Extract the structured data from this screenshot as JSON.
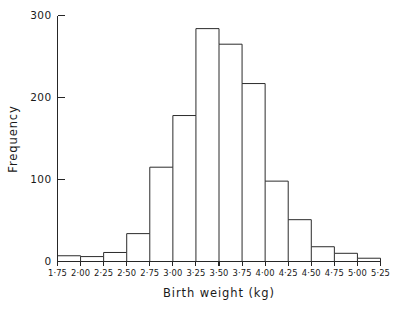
{
  "chart_data": {
    "type": "bar",
    "title": "",
    "subtitle": "",
    "xlabel": "Birth weight (kg)",
    "ylabel": "Frequency",
    "xlim": [
      1.75,
      5.25
    ],
    "ylim": [
      0,
      300
    ],
    "grid": false,
    "legend": "none",
    "bin_width": 0.25,
    "bin_edges": [
      1.75,
      2.0,
      2.25,
      2.5,
      2.75,
      3.0,
      3.25,
      3.5,
      3.75,
      4.0,
      4.25,
      4.5,
      4.75,
      5.0,
      5.25
    ],
    "categories": [
      "1·75-2·00",
      "2·00-2·25",
      "2·25-2·50",
      "2·50-2·75",
      "2·75-3·00",
      "3·00-3·25",
      "3·25-3·50",
      "3·50-3·75",
      "3·75-4·00",
      "4·00-4·25",
      "4·25-4·50",
      "4·50-4·75",
      "4·75-5·00",
      "5·00-5·25"
    ],
    "values": [
      7,
      6,
      11,
      34,
      115,
      178,
      284,
      265,
      217,
      98,
      51,
      18,
      10,
      4
    ],
    "xtick_labels": [
      "1·75",
      "2·00",
      "2·25",
      "2·50",
      "2·75",
      "3·00",
      "3·25",
      "3·50",
      "3·75",
      "4·00",
      "4·25",
      "4·50",
      "4·75",
      "5·00",
      "5·25"
    ],
    "ytick_labels": [
      "0",
      "100",
      "200",
      "300"
    ],
    "ytick_values": [
      0,
      100,
      200,
      300
    ],
    "colors": {
      "axis": "#262626",
      "bar_stroke": "#2b2b2b",
      "bar_fill": "none",
      "background": "#ffffff",
      "text": "#1a1a1a"
    }
  }
}
